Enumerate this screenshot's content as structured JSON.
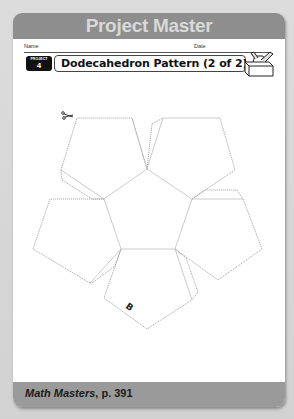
{
  "header": {
    "title": "Project Master"
  },
  "fields": {
    "name_label": "Name",
    "date_label": "Date"
  },
  "project_badge": {
    "word": "PROJECT",
    "number": "4"
  },
  "worksheet": {
    "title": "Dodecahedron Pattern (2 of 2)",
    "icon": "toolbox-icon"
  },
  "pattern": {
    "shape": "dodecahedron net half",
    "faces": 6,
    "label": "B",
    "cut_icon": "scissors-icon",
    "cut_line_style": "dashed",
    "fold_line_style": "solid"
  },
  "footer": {
    "source": "Math Masters",
    "page": ", p. 391"
  },
  "colors": {
    "header_band": "#8e8e8e",
    "header_text": "#d9d9d9",
    "footer_band": "#9a9a9a",
    "badge": "#111111",
    "background": "#d6d6d6"
  }
}
